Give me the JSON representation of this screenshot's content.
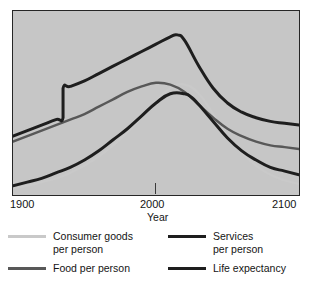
{
  "chart_data": {
    "type": "line",
    "title": "",
    "subtitle": "",
    "xlabel": "Year",
    "ylabel": "",
    "xlim": [
      1900,
      2100
    ],
    "ylim": [
      0,
      100
    ],
    "xticks": [
      1900,
      2000,
      2100
    ],
    "xticklabels": [
      "1900",
      "2000",
      "2100"
    ],
    "yticks": [],
    "yticklabels": [],
    "grid": false,
    "legend_position": "below",
    "annotations": [],
    "series": [
      {
        "name": "Consumer goods per person",
        "color": "#c9c9c9",
        "linewidth": 2.2,
        "x": [
          1900,
          1910,
          1920,
          1930,
          1940,
          1950,
          1960,
          1970,
          1980,
          1990,
          2000,
          2010,
          2020,
          2030,
          2040,
          2050,
          2060,
          2070,
          2080,
          2090,
          2100
        ],
        "y": [
          4,
          5,
          7,
          9,
          12,
          16,
          21,
          27,
          34,
          42,
          51,
          58,
          60,
          55,
          44,
          32,
          23,
          16,
          11,
          8,
          6
        ]
      },
      {
        "name": "Food per person",
        "color": "#585858",
        "linewidth": 2.4,
        "x": [
          1900,
          1910,
          1920,
          1930,
          1940,
          1950,
          1960,
          1970,
          1980,
          1990,
          2000,
          2010,
          2020,
          2030,
          2040,
          2050,
          2060,
          2070,
          2080,
          2090,
          2100
        ],
        "y": [
          29,
          32,
          35,
          38,
          41,
          44,
          48,
          52,
          56,
          59,
          61,
          60,
          56,
          49,
          42,
          36,
          32,
          29,
          27,
          26,
          25
        ]
      },
      {
        "name": "Services per person",
        "color": "#1e1e1e",
        "linewidth": 3.0,
        "step_year": 1935,
        "x": [
          1900,
          1910,
          1920,
          1930,
          1935,
          1935,
          1940,
          1950,
          1960,
          1970,
          1980,
          1990,
          2000,
          2010,
          2015,
          2020,
          2030,
          2040,
          2050,
          2060,
          2070,
          2080,
          2090,
          2100
        ],
        "y": [
          32,
          35,
          38,
          41,
          42,
          58,
          59,
          62,
          66,
          70,
          74,
          78,
          82,
          86,
          87,
          84,
          70,
          58,
          50,
          45,
          42,
          40,
          39,
          38
        ]
      },
      {
        "name": "Life expectancy",
        "color": "#1e1e1e",
        "linewidth": 3.0,
        "x": [
          1900,
          1910,
          1920,
          1930,
          1940,
          1950,
          1960,
          1970,
          1980,
          1990,
          2000,
          2010,
          2020,
          2025,
          2030,
          2040,
          2050,
          2060,
          2070,
          2080,
          2090,
          2100
        ],
        "y": [
          5,
          7,
          9,
          12,
          15,
          19,
          24,
          30,
          36,
          43,
          50,
          55,
          55,
          53,
          49,
          40,
          31,
          24,
          19,
          15,
          13,
          11
        ]
      }
    ]
  },
  "axis": {
    "xlabel": "Year",
    "tick_left": "1900",
    "tick_mid": "2000",
    "tick_right": "2100"
  },
  "legend": {
    "items": [
      {
        "label": "Consumer goods\nper person",
        "color": "#c9c9c9"
      },
      {
        "label": "Services\nper person",
        "color": "#1e1e1e"
      },
      {
        "label": "Food per person",
        "color": "#585858"
      },
      {
        "label": "Life expectancy",
        "color": "#1e1e1e"
      }
    ]
  },
  "colors": {
    "plot_background": "#c6c6c6",
    "page_background": "#ffffff",
    "frame": "#262626",
    "text": "#141414"
  }
}
